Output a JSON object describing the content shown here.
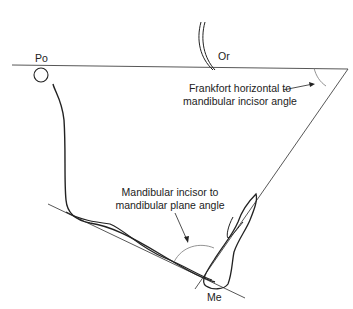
{
  "labels": {
    "po": "Po",
    "or": "Or",
    "me": "Me",
    "fh_angle_line1": "Frankfort horizontal to",
    "fh_angle_line2": "mandibular incisor angle",
    "mp_angle_line1": "Mandibular incisor to",
    "mp_angle_line2": "mandibular plane angle"
  },
  "colors": {
    "line": "#222222",
    "thin": "#555555",
    "background": "#ffffff"
  }
}
